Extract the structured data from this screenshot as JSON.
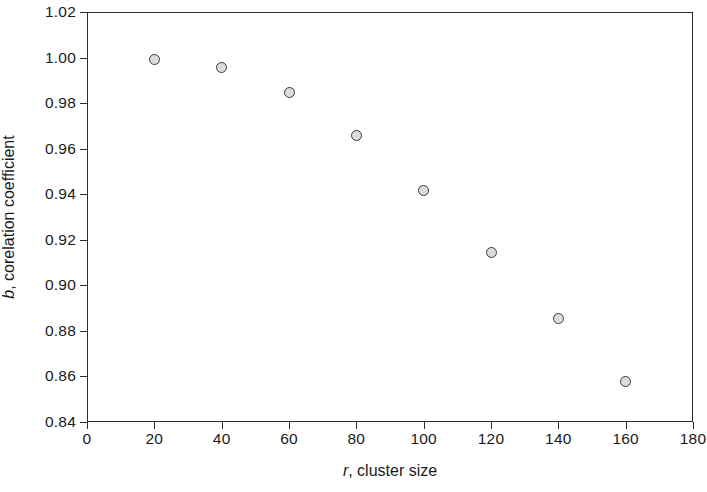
{
  "chart_data": {
    "type": "scatter",
    "title": "",
    "xlabel": "r, cluster size",
    "xlabel_italic_prefix": "r",
    "xlabel_rest": ", cluster size",
    "ylabel": "b, corelation coefficient",
    "ylabel_italic_prefix": "b",
    "ylabel_rest": ", corelation coefficient",
    "xlim": [
      0,
      180
    ],
    "ylim": [
      0.84,
      1.02
    ],
    "xticks": [
      0,
      20,
      40,
      60,
      80,
      100,
      120,
      140,
      160,
      180
    ],
    "xtick_labels": [
      "0",
      "20",
      "40",
      "60",
      "80",
      "100",
      "120",
      "140",
      "160",
      "180"
    ],
    "yticks": [
      0.84,
      0.86,
      0.88,
      0.9,
      0.92,
      0.94,
      0.96,
      0.98,
      1.0,
      1.02
    ],
    "ytick_labels": [
      "0.84",
      "0.86",
      "0.88",
      "0.90",
      "0.92",
      "0.94",
      "0.96",
      "0.98",
      "1.00",
      "1.02"
    ],
    "grid": false,
    "legend": null,
    "x": [
      20,
      40,
      60,
      80,
      100,
      120,
      140,
      160
    ],
    "values": [
      0.9993,
      0.9955,
      0.9847,
      0.9658,
      0.9417,
      0.9145,
      0.8855,
      0.8577
    ],
    "points": [
      {
        "x": 20,
        "y": 0.9993
      },
      {
        "x": 40,
        "y": 0.9955
      },
      {
        "x": 60,
        "y": 0.9847
      },
      {
        "x": 80,
        "y": 0.9658
      },
      {
        "x": 100,
        "y": 0.9417
      },
      {
        "x": 120,
        "y": 0.9145
      },
      {
        "x": 140,
        "y": 0.8855
      },
      {
        "x": 160,
        "y": 0.8577
      }
    ],
    "marker": {
      "shape": "circle-open",
      "fill_color": "#dcdcdc",
      "edge_color": "#3a3a3a",
      "size_px": 11
    },
    "axis_color": "#2b2b2b",
    "background_color": "#ffffff",
    "tick_direction": "out"
  }
}
